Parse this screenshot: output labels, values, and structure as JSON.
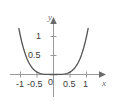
{
  "figure": {
    "background_color": "#ffffff",
    "curve_color": "#555555",
    "axis_color": "#9a9a9a",
    "tick_label_color": "#3b3b3b",
    "axis_name_color": "#6b6b6b"
  },
  "chart_data": {
    "type": "line",
    "title": "",
    "xlabel": "x",
    "ylabel": "y",
    "xlim": [
      -1.25,
      1.25
    ],
    "ylim": [
      -0.25,
      1.45
    ],
    "grid": false,
    "legend": null,
    "x_tick_labels": [
      "-1",
      "-0.5",
      "0",
      "0.5",
      "1"
    ],
    "x_ticks": [
      -1,
      -0.5,
      0,
      0.5,
      1
    ],
    "y_tick_labels": [
      "0.5",
      "1"
    ],
    "y_ticks": [
      0.5,
      1
    ],
    "origin_label": "0",
    "series": [
      {
        "name": "y = x^4",
        "x": [
          -1.15,
          -1.1,
          -1.05,
          -1.0,
          -0.95,
          -0.9,
          -0.85,
          -0.8,
          -0.75,
          -0.7,
          -0.65,
          -0.6,
          -0.55,
          -0.5,
          -0.45,
          -0.4,
          -0.35,
          -0.3,
          -0.25,
          -0.2,
          -0.15,
          -0.1,
          -0.05,
          0.0,
          0.05,
          0.1,
          0.15,
          0.2,
          0.25,
          0.3,
          0.35,
          0.4,
          0.45,
          0.5,
          0.55,
          0.6,
          0.65,
          0.7,
          0.75,
          0.8,
          0.85,
          0.9,
          0.95,
          1.0,
          1.05,
          1.1,
          1.15
        ],
        "y": [
          1.749,
          1.464,
          1.216,
          1.0,
          0.815,
          0.656,
          0.522,
          0.41,
          0.316,
          0.24,
          0.179,
          0.13,
          0.092,
          0.063,
          0.041,
          0.026,
          0.015,
          0.008,
          0.004,
          0.002,
          0.001,
          0.0,
          0.0,
          0.0,
          0.0,
          0.0,
          0.001,
          0.002,
          0.004,
          0.008,
          0.015,
          0.026,
          0.041,
          0.063,
          0.092,
          0.13,
          0.179,
          0.24,
          0.316,
          0.41,
          0.522,
          0.656,
          0.815,
          1.0,
          1.216,
          1.464,
          1.749
        ]
      }
    ]
  }
}
